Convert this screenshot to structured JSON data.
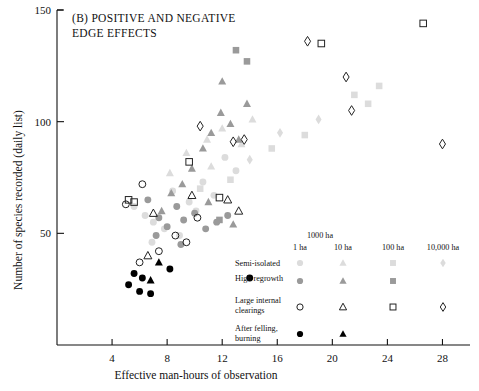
{
  "panel": {
    "title_line1": "(B) POSITIVE AND NEGATIVE",
    "title_line2": "EDGE EFFECTS"
  },
  "axes": {
    "xlabel": "Effective man-hours of observation",
    "ylabel": "Number of species recorded (daily list)",
    "xticks": [
      "4",
      "8",
      "12",
      "16",
      "20",
      "24",
      "28"
    ],
    "yticks": [
      "50",
      "100",
      "150"
    ]
  },
  "legend": {
    "headers": [
      "1 ha",
      "10 ha",
      "100 ha",
      "1000 ha",
      "10,000 ha"
    ],
    "rows": [
      {
        "label_line1": "Semi-isolated",
        "label_line2": ""
      },
      {
        "label_line1": "High regrowth",
        "label_line2": ""
      },
      {
        "label_line1": "Large internal",
        "label_line2": "clearings"
      },
      {
        "label_line1": "After felling,",
        "label_line2": "burning"
      }
    ]
  },
  "colors": {
    "semi_isolated": "#dcdcdc",
    "high_regrowth": "#9a9a9a",
    "open_stroke": "#222222",
    "filled": "#000000",
    "axis": "#111111"
  },
  "chart_data": {
    "type": "scatter",
    "title": "(B) POSITIVE AND NEGATIVE EDGE EFFECTS",
    "xlabel": "Effective man-hours of observation",
    "ylabel": "Number of species recorded (daily list)",
    "xlim": [
      0,
      30
    ],
    "ylim": [
      0,
      150
    ],
    "xticks": [
      4,
      8,
      12,
      16,
      20,
      24,
      28
    ],
    "yticks": [
      50,
      100,
      150
    ],
    "grid": false,
    "legend_position": "lower-right",
    "series": [
      {
        "name": "Semi-isolated 1 ha",
        "marker": "circle",
        "fill": "#dcdcdc",
        "points": [
          [
            5.6,
            62
          ],
          [
            6.4,
            58
          ],
          [
            7.0,
            55
          ],
          [
            7.8,
            52
          ],
          [
            8.4,
            69
          ],
          [
            9.6,
            64
          ],
          [
            10.1,
            60
          ],
          [
            10.6,
            73
          ],
          [
            11.4,
            67
          ],
          [
            12.2,
            84
          ],
          [
            13.0,
            78
          ],
          [
            6.9,
            46
          ],
          [
            8.9,
            49
          ]
        ]
      },
      {
        "name": "Semi-isolated 10 ha",
        "marker": "triangle",
        "fill": "#dcdcdc",
        "points": [
          [
            8.2,
            77
          ],
          [
            9.4,
            86
          ],
          [
            10.9,
            92
          ],
          [
            12.0,
            97
          ],
          [
            13.4,
            90
          ],
          [
            14.2,
            101
          ],
          [
            11.2,
            80
          ]
        ]
      },
      {
        "name": "Semi-isolated 100 ha",
        "marker": "square",
        "fill": "#dcdcdc",
        "points": [
          [
            10.4,
            70
          ],
          [
            12.6,
            74
          ],
          [
            15.6,
            88
          ],
          [
            18.0,
            94
          ],
          [
            21.6,
            112
          ],
          [
            22.6,
            108
          ],
          [
            23.4,
            116
          ]
        ]
      },
      {
        "name": "Semi-isolated 1000/10,000 ha",
        "marker": "diamond",
        "fill": "#dcdcdc",
        "points": [
          [
            14.0,
            83
          ],
          [
            16.2,
            95
          ],
          [
            19.0,
            101
          ]
        ]
      },
      {
        "name": "High regrowth 1 ha",
        "marker": "circle",
        "fill": "#9a9a9a",
        "points": [
          [
            6.6,
            65
          ],
          [
            7.4,
            57
          ],
          [
            8.0,
            53
          ],
          [
            8.7,
            62
          ],
          [
            9.2,
            56
          ],
          [
            10.0,
            59
          ],
          [
            10.8,
            52
          ],
          [
            11.6,
            55
          ],
          [
            7.2,
            49
          ],
          [
            9.0,
            45
          ],
          [
            12.4,
            58
          ]
        ]
      },
      {
        "name": "High regrowth 10 ha",
        "marker": "triangle",
        "fill": "#9a9a9a",
        "points": [
          [
            7.6,
            60
          ],
          [
            8.3,
            68
          ],
          [
            9.1,
            72
          ],
          [
            9.8,
            79
          ],
          [
            10.6,
            88
          ],
          [
            11.2,
            95
          ],
          [
            11.9,
            104
          ],
          [
            12.6,
            99
          ],
          [
            13.2,
            92
          ],
          [
            13.8,
            108
          ],
          [
            12.0,
            118
          ],
          [
            11.0,
            64
          ],
          [
            12.8,
            54
          ]
        ]
      },
      {
        "name": "High regrowth 100 ha",
        "marker": "square",
        "fill": "#9a9a9a",
        "points": [
          [
            11.8,
            56
          ],
          [
            13.0,
            132
          ],
          [
            13.8,
            127
          ]
        ]
      },
      {
        "name": "Large internal clearings 1 ha",
        "marker": "circle-open",
        "points": [
          [
            5.0,
            63
          ],
          [
            6.2,
            72
          ],
          [
            7.4,
            42
          ],
          [
            8.6,
            49
          ],
          [
            9.4,
            46
          ],
          [
            10.2,
            57
          ],
          [
            6.0,
            37
          ]
        ]
      },
      {
        "name": "Large internal clearings 10 ha",
        "marker": "triangle-open",
        "points": [
          [
            6.6,
            40
          ],
          [
            7.0,
            59
          ],
          [
            9.8,
            67
          ],
          [
            12.4,
            65
          ],
          [
            13.2,
            60
          ]
        ]
      },
      {
        "name": "Large internal clearings 100 ha",
        "marker": "square-open",
        "points": [
          [
            5.2,
            65
          ],
          [
            5.6,
            64
          ],
          [
            9.6,
            82
          ],
          [
            11.8,
            66
          ],
          [
            19.2,
            135
          ],
          [
            26.6,
            144
          ]
        ]
      },
      {
        "name": "Large internal clearings 1000/10,000 ha",
        "marker": "diamond-open",
        "points": [
          [
            10.4,
            98
          ],
          [
            12.8,
            91
          ],
          [
            13.6,
            92
          ],
          [
            18.2,
            136
          ],
          [
            21.0,
            120
          ],
          [
            21.4,
            105
          ],
          [
            28.0,
            90
          ]
        ]
      },
      {
        "name": "After felling, burning 1 ha",
        "marker": "circle-filled",
        "points": [
          [
            5.6,
            32
          ],
          [
            6.2,
            30
          ],
          [
            5.2,
            27
          ],
          [
            6.0,
            24
          ],
          [
            6.8,
            23
          ],
          [
            8.2,
            34
          ],
          [
            14.0,
            30
          ]
        ]
      },
      {
        "name": "After felling, burning 10 ha",
        "marker": "triangle-filled",
        "points": [
          [
            7.4,
            37
          ],
          [
            6.8,
            29
          ]
        ]
      }
    ]
  }
}
